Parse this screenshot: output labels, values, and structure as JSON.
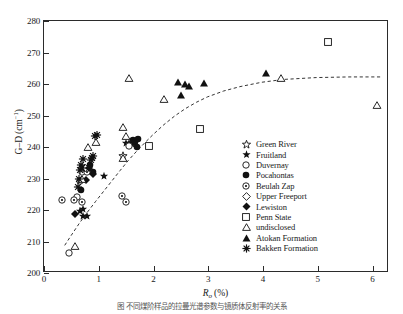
{
  "figure": {
    "caption": "图  不同煤阶样品的拉曼光谱参数与镜质体反射率的关系"
  },
  "chart_data": {
    "type": "scatter",
    "title": "",
    "xlabel": "Ro (%)",
    "ylabel": "G–D (cm-1)",
    "xlim": [
      0,
      6.3
    ],
    "ylim": [
      200,
      280
    ],
    "xticks": [
      0,
      1,
      2,
      3,
      4,
      5,
      6
    ],
    "yticks": [
      200,
      210,
      220,
      230,
      240,
      250,
      260,
      270,
      280
    ],
    "grid": false,
    "legend_position": "right-inside",
    "trend_line": {
      "style": "dashed",
      "points": [
        [
          0.38,
          208.2
        ],
        [
          0.5,
          211.4
        ],
        [
          0.65,
          215.3
        ],
        [
          0.8,
          218.9
        ],
        [
          0.95,
          222.3
        ],
        [
          1.1,
          225.6
        ],
        [
          1.25,
          228.9
        ],
        [
          1.4,
          232.2
        ],
        [
          1.55,
          235.4
        ],
        [
          1.7,
          238.3
        ],
        [
          1.85,
          241.0
        ],
        [
          2.0,
          243.6
        ],
        [
          2.2,
          246.8
        ],
        [
          2.4,
          249.6
        ],
        [
          2.6,
          252.0
        ],
        [
          2.8,
          254.0
        ],
        [
          3.0,
          255.7
        ],
        [
          3.3,
          257.6
        ],
        [
          3.6,
          259.0
        ],
        [
          4.0,
          260.4
        ],
        [
          4.4,
          261.3
        ],
        [
          5.0,
          261.9
        ],
        [
          5.6,
          262.1
        ],
        [
          6.2,
          262.1
        ]
      ]
    },
    "series": [
      {
        "name": "Green River",
        "marker": "open-star",
        "points": [
          [
            1.44,
            237.0
          ]
        ]
      },
      {
        "name": "Fruitland",
        "marker": "filled-star",
        "points": [
          [
            0.66,
            219.8
          ],
          [
            0.72,
            220.3
          ],
          [
            0.72,
            218.0
          ],
          [
            0.78,
            218.2
          ],
          [
            1.1,
            230.7
          ],
          [
            1.5,
            241.4
          ],
          [
            1.56,
            241.2
          ],
          [
            1.6,
            241.0
          ]
        ]
      },
      {
        "name": "Duvernay",
        "marker": "open-circle",
        "points": [
          [
            0.45,
            206.2
          ],
          [
            0.6,
            224.1
          ],
          [
            0.66,
            229.3
          ],
          [
            0.7,
            232.2
          ],
          [
            0.76,
            233.1
          ],
          [
            1.56,
            240.2
          ]
        ]
      },
      {
        "name": "Pocahontas",
        "marker": "filled-circle",
        "points": [
          [
            0.68,
            226.4
          ],
          [
            0.84,
            234.3
          ],
          [
            0.9,
            232.2
          ],
          [
            1.62,
            242.2
          ],
          [
            1.66,
            241.6
          ],
          [
            1.72,
            242.4
          ],
          [
            1.7,
            240.0
          ]
        ]
      },
      {
        "name": "Beulah Zap",
        "marker": "dot-circle",
        "points": [
          [
            0.32,
            223.3
          ],
          [
            0.54,
            223.1
          ],
          [
            0.7,
            222.4
          ],
          [
            0.78,
            232.0
          ],
          [
            1.42,
            224.6
          ],
          [
            1.5,
            222.5
          ]
        ]
      },
      {
        "name": "Upper Freeport",
        "marker": "open-diamond",
        "points": [
          [
            0.74,
            233.4
          ]
        ]
      },
      {
        "name": "Lewiston",
        "marker": "filled-diamond",
        "points": [
          [
            0.56,
            218.8
          ],
          [
            0.76,
            229.5
          ],
          [
            0.82,
            233.3
          ],
          [
            0.9,
            231.4
          ]
        ]
      },
      {
        "name": "Penn State",
        "marker": "open-square",
        "points": [
          [
            1.92,
            240.4
          ],
          [
            2.84,
            245.6
          ],
          [
            5.18,
            273.2
          ]
        ]
      },
      {
        "name": "undisclosed",
        "marker": "open-triangle",
        "points": [
          [
            0.56,
            208.5
          ],
          [
            0.7,
            230.0
          ],
          [
            0.8,
            240.1
          ],
          [
            0.95,
            241.6
          ],
          [
            1.44,
            246.4
          ],
          [
            1.5,
            243.5
          ],
          [
            1.44,
            236.5
          ],
          [
            1.56,
            262.0
          ],
          [
            2.2,
            255.3
          ],
          [
            4.32,
            262.0
          ],
          [
            6.08,
            253.3
          ]
        ]
      },
      {
        "name": "Atokan Formation",
        "marker": "filled-triangle",
        "points": [
          [
            2.44,
            260.6
          ],
          [
            2.5,
            256.6
          ],
          [
            2.58,
            259.9
          ],
          [
            2.64,
            259.3
          ],
          [
            2.92,
            260.3
          ],
          [
            4.06,
            263.6
          ]
        ]
      },
      {
        "name": "Bakken Formation",
        "marker": "asterisk",
        "points": [
          [
            0.62,
            227.2
          ],
          [
            0.66,
            232.8
          ],
          [
            0.68,
            234.2
          ],
          [
            0.7,
            233.2
          ],
          [
            0.64,
            229.7
          ],
          [
            0.88,
            236.5
          ],
          [
            0.9,
            237.0
          ],
          [
            0.94,
            243.4
          ],
          [
            0.96,
            243.8
          ],
          [
            0.72,
            236.3
          ],
          [
            0.86,
            235.9
          ]
        ]
      }
    ]
  },
  "legend": {
    "items": [
      {
        "label": "Green River",
        "marker": "open-star"
      },
      {
        "label": "Fruitland",
        "marker": "filled-star"
      },
      {
        "label": "Duvernay",
        "marker": "open-circle"
      },
      {
        "label": "Pocahontas",
        "marker": "filled-circle"
      },
      {
        "label": "Beulah Zap",
        "marker": "dot-circle"
      },
      {
        "label": "Upper Freeport",
        "marker": "open-diamond"
      },
      {
        "label": "Lewiston",
        "marker": "filled-diamond"
      },
      {
        "label": "Penn State",
        "marker": "open-square"
      },
      {
        "label": "undisclosed",
        "marker": "open-triangle"
      },
      {
        "label": "Atokan Formation",
        "marker": "filled-triangle"
      },
      {
        "label": "Bakken Formation",
        "marker": "asterisk"
      }
    ]
  },
  "colors": {
    "axis": "#2b2b2b",
    "marker": "#111111",
    "trend": "#333333",
    "background": "#ffffff"
  }
}
